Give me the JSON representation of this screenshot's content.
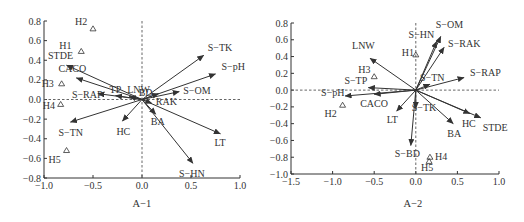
{
  "chart_data": [
    {
      "type": "scatter",
      "subtype": "ordination-biplot",
      "title": "A−1",
      "xlabel": "",
      "ylabel": "",
      "xlim": [
        -1.0,
        1.0
      ],
      "ylim": [
        -0.8,
        0.8
      ],
      "x_ticks": [
        "−1.0",
        "−0.5",
        "0.0",
        "0.5",
        "1.0"
      ],
      "y_ticks": [
        "0.8",
        "0.6",
        "0.4",
        "0.2",
        "0.0",
        "−0.2",
        "−0.4",
        "−0.6",
        "−0.8"
      ],
      "grid": false,
      "reference_lines": "dashed lines at x=0 and y=0",
      "vectors": [
        {
          "name": "S−TK",
          "x": 0.63,
          "y": 0.45
        },
        {
          "name": "S−pH",
          "x": 0.75,
          "y": 0.26
        },
        {
          "name": "STDE",
          "x": -0.77,
          "y": 0.35
        },
        {
          "name": "CACO",
          "x": -0.67,
          "y": 0.22
        },
        {
          "name": "S−RAP",
          "x": -0.45,
          "y": 0.06
        },
        {
          "name": "TP",
          "x": -0.27,
          "y": 0.04
        },
        {
          "name": "LNW",
          "x": -0.13,
          "y": 0.03
        },
        {
          "name": "BD",
          "x": 0.17,
          "y": 0.06
        },
        {
          "name": "S−OM",
          "x": 0.38,
          "y": 0.08
        },
        {
          "name": "RAK",
          "x": 0.1,
          "y": -0.04
        },
        {
          "name": "BA",
          "x": 0.14,
          "y": -0.15
        },
        {
          "name": "HC",
          "x": -0.2,
          "y": -0.22
        },
        {
          "name": "S−TN",
          "x": -0.73,
          "y": -0.23
        },
        {
          "name": "LT",
          "x": 0.8,
          "y": -0.35
        },
        {
          "name": "S−HN",
          "x": 0.52,
          "y": -0.65
        }
      ],
      "sites": [
        {
          "name": "H1",
          "x": -0.62,
          "y": 0.49
        },
        {
          "name": "H2",
          "x": -0.5,
          "y": 0.72
        },
        {
          "name": "H3",
          "x": -0.82,
          "y": 0.16
        },
        {
          "name": "H4",
          "x": -0.83,
          "y": -0.05
        },
        {
          "name": "H5",
          "x": -0.77,
          "y": -0.52
        }
      ]
    },
    {
      "type": "scatter",
      "subtype": "ordination-biplot",
      "title": "A−2",
      "xlabel": "",
      "ylabel": "",
      "xlim": [
        -1.5,
        1.0
      ],
      "ylim": [
        -1.0,
        0.8
      ],
      "x_ticks": [
        "−1.5",
        "−1.0",
        "−0.5",
        "0.0",
        "0.5",
        "1.0"
      ],
      "y_ticks": [
        "0.8",
        "0.6",
        "0.4",
        "0.2",
        "0.0",
        "−0.2",
        "−0.4",
        "−0.6",
        "−0.8",
        "−1.0"
      ],
      "grid": false,
      "reference_lines": "dashed lines at x=0 and y=0",
      "vectors": [
        {
          "name": "S−OM",
          "x": 0.3,
          "y": 0.64
        },
        {
          "name": "S−HN",
          "x": 0.25,
          "y": 0.58
        },
        {
          "name": "S−RAK",
          "x": 0.34,
          "y": 0.51
        },
        {
          "name": "S−TN",
          "x": 0.17,
          "y": 0.07
        },
        {
          "name": "S−RAP",
          "x": 0.58,
          "y": 0.15
        },
        {
          "name": "LNW",
          "x": -0.55,
          "y": 0.38
        },
        {
          "name": "S−TP",
          "x": -0.57,
          "y": 0.03
        },
        {
          "name": "S−pH",
          "x": -0.85,
          "y": -0.07
        },
        {
          "name": "CACO",
          "x": -0.5,
          "y": -0.05
        },
        {
          "name": "LT",
          "x": -0.23,
          "y": -0.25
        },
        {
          "name": "S−TK",
          "x": 0.0,
          "y": -0.22
        },
        {
          "name": "S−BD",
          "x": -0.06,
          "y": -0.66
        },
        {
          "name": "BA",
          "x": 0.45,
          "y": -0.4
        },
        {
          "name": "HC",
          "x": 0.65,
          "y": -0.28
        },
        {
          "name": "STDE",
          "x": 0.78,
          "y": -0.33
        }
      ],
      "sites": [
        {
          "name": "H1",
          "x": 0.0,
          "y": 0.42
        },
        {
          "name": "H2",
          "x": -0.88,
          "y": -0.18
        },
        {
          "name": "H3",
          "x": -0.5,
          "y": 0.16
        },
        {
          "name": "H4",
          "x": 0.17,
          "y": -0.8
        },
        {
          "name": "H5",
          "x": 0.16,
          "y": -0.85
        }
      ]
    }
  ]
}
